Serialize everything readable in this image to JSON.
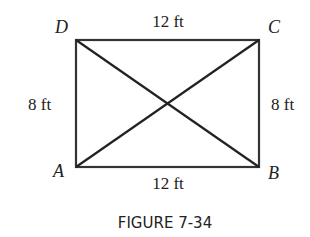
{
  "figure": {
    "caption": "FIGURE 7-34",
    "vertices": {
      "A": "A",
      "B": "B",
      "C": "C",
      "D": "D"
    },
    "sides": {
      "top": "12 ft",
      "bottom": "12 ft",
      "left": "8 ft",
      "right": "8 ft"
    },
    "colors": {
      "stroke": "#333333",
      "text": "#222222",
      "background": "#ffffff"
    }
  }
}
